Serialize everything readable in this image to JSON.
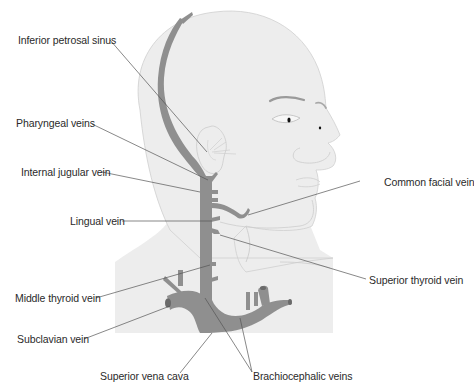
{
  "diagram": {
    "colors": {
      "skin": "#ededed",
      "skin_outline": "#c8c8c8",
      "vein": "#8f8f8f",
      "vein_dark": "#6a6a6a",
      "leader_line": "#555555",
      "label_text": "#2a2a2a",
      "eye": "#111111"
    },
    "labels": [
      {
        "id": "inferior-petrosal-sinus",
        "text": "Inferior petrosal sinus",
        "side": "left"
      },
      {
        "id": "pharyngeal-veins",
        "text": "Pharyngeal veins",
        "side": "left"
      },
      {
        "id": "internal-jugular-vein",
        "text": "Internal jugular vein",
        "side": "left"
      },
      {
        "id": "lingual-vein",
        "text": "Lingual vein",
        "side": "left"
      },
      {
        "id": "middle-thyroid-vein",
        "text": "Middle thyroid vein",
        "side": "left"
      },
      {
        "id": "subclavian-vein",
        "text": "Subclavian vein",
        "side": "left"
      },
      {
        "id": "superior-vena-cava",
        "text": "Superior vena cava",
        "side": "bottom"
      },
      {
        "id": "brachiocephalic-veins",
        "text": "Brachiocephalic veins",
        "side": "bottom"
      },
      {
        "id": "common-facial-vein",
        "text": "Common facial vein",
        "side": "right"
      },
      {
        "id": "superior-thyroid-vein",
        "text": "Superior thyroid vein",
        "side": "right"
      }
    ]
  }
}
